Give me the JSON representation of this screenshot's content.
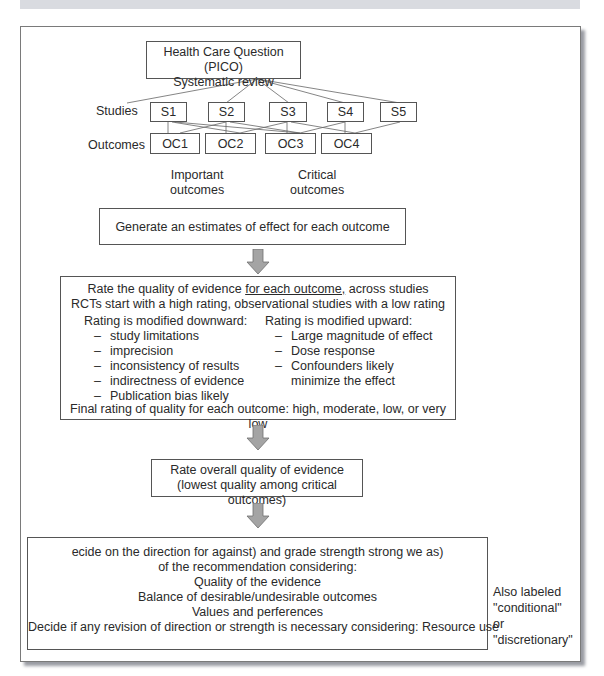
{
  "figure": {
    "pico_box": {
      "line1": "Health Care Question (PICO)",
      "line2": "Systematic review"
    },
    "row_labels": {
      "studies": "Studies",
      "outcomes": "Outcomes"
    },
    "studies": [
      "S1",
      "S2",
      "S3",
      "S4",
      "S5"
    ],
    "outcomes": [
      "OC1",
      "OC2",
      "OC3",
      "OC4"
    ],
    "outcome_groups": [
      {
        "line1": "Important",
        "line2": "outcomes"
      },
      {
        "line1": "Critical",
        "line2": "outcomes"
      }
    ],
    "estimate_box": "Generate an estimates of effect for each outcome",
    "rating_box": {
      "title_pre": "Rate the quality of evidence ",
      "title_underlined": "for each outcome,",
      "title_post": " across studies",
      "subtitle": "RCTs start with a high rating, observational studies with a low rating",
      "downward": {
        "heading": "Rating is modified downward:",
        "items": [
          "study limitations",
          "imprecision",
          "inconsistency of results",
          "indirectness of evidence",
          "Publication bias likely"
        ]
      },
      "upward": {
        "heading": "Rating is modified upward:",
        "items": [
          "Large magnitude of effect",
          "Dose response",
          "Confounders likely"
        ],
        "continuation": "minimize the effect"
      },
      "final": "Final rating of quality for each outcome: high, moderate, low, or very low"
    },
    "overall_box": {
      "line1": "Rate overall quality of evidence",
      "line2": "(lowest quality among critical outcomes)"
    },
    "decision_box": {
      "lines": [
        "ecide on the direction for against) and grade strength strong we as)",
        "of the recommendation considering:",
        "Quality of the evidence",
        "Balance of desirable/undesirable outcomes",
        "Values and perferences",
        "Decide if any revision of direction or strength is necessary considering: Resource use"
      ]
    },
    "side_note": {
      "lines": [
        "Also labeled",
        "\"conditional\"",
        "or",
        "\"discretionary\""
      ]
    },
    "dash_glyph": "–",
    "colors": {
      "arrow_fill": "#a4a4a4",
      "arrow_stroke": "#6e6e6e",
      "border": "#555555",
      "shadow": "#9a9ca3",
      "topbar": "#d9dbe0"
    }
  }
}
